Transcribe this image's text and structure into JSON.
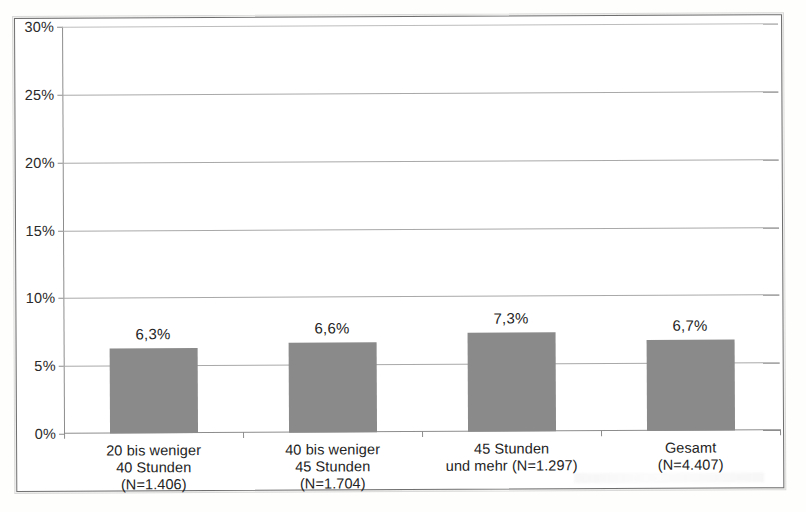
{
  "chart_data": {
    "type": "bar",
    "title": "",
    "subtitle": "",
    "xlabel": "",
    "ylabel": "",
    "ylim": [
      0,
      30
    ],
    "y_tick_labels": [
      "0%",
      "5%",
      "10%",
      "15%",
      "20%",
      "25%",
      "30%"
    ],
    "y_tick_values": [
      0,
      5,
      10,
      15,
      20,
      25,
      30
    ],
    "grid": true,
    "grid_axis": "y",
    "legend": false,
    "legend_position": "none",
    "categories": [
      "20 bis weniger\n40 Stunden\n(N=1.406)",
      "40 bis weniger\n45 Stunden\n(N=1.704)",
      "45 Stunden\nund mehr (N=1.297)",
      "Gesamt\n(N=4.407)"
    ],
    "values": [
      6.3,
      6.6,
      7.3,
      6.7
    ],
    "value_labels": [
      "6,3%",
      "6,6%",
      "7,3%",
      "6,7%"
    ],
    "bar_color": "#8a8a8a",
    "axis_color": "#8d8d8d",
    "grid_color": "#a9a9a9",
    "text_color": "#232323",
    "background_color": "#ffffff"
  }
}
